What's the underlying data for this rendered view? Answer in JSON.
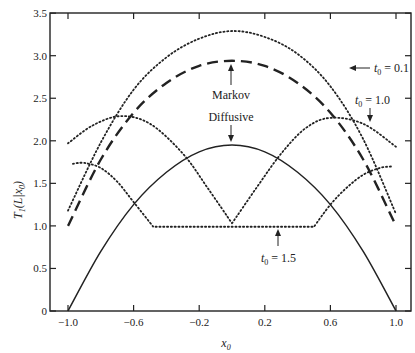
{
  "chart_data": {
    "type": "line",
    "title": "",
    "xlabel": "x0",
    "ylabel": "T1(L|x0)",
    "xlim": [
      -1.05,
      1.1
    ],
    "ylim": [
      0,
      3.5
    ],
    "x_ticks": [
      -1.0,
      -0.6,
      -0.2,
      0.2,
      0.6,
      1.0
    ],
    "x_tick_labels": [
      "-1.0",
      "-0.6",
      "-0.2",
      "0.2",
      "0.6",
      "1.0"
    ],
    "y_ticks": [
      0,
      0.5,
      1.0,
      1.5,
      2.0,
      2.5,
      3.0,
      3.5
    ],
    "y_tick_labels": [
      "0",
      "0.5",
      "1.0",
      "1.5",
      "2.0",
      "2.5",
      "3.0",
      "3.5"
    ],
    "grid": false,
    "legend": null,
    "series": [
      {
        "name": "Diffusive",
        "style": "solid",
        "x": [
          -1.0,
          -0.8,
          -0.6,
          -0.4,
          -0.2,
          0.0,
          0.2,
          0.4,
          0.6,
          0.8,
          1.0
        ],
        "y": [
          0.0,
          0.7,
          1.25,
          1.63,
          1.87,
          1.95,
          1.87,
          1.63,
          1.25,
          0.7,
          0.0
        ]
      },
      {
        "name": "Markov",
        "style": "dashed",
        "x": [
          -1.0,
          -0.8,
          -0.6,
          -0.4,
          -0.2,
          0.0,
          0.2,
          0.4,
          0.6,
          0.8,
          1.0
        ],
        "y": [
          1.0,
          1.78,
          2.33,
          2.68,
          2.88,
          2.94,
          2.88,
          2.68,
          2.33,
          1.78,
          1.0
        ]
      },
      {
        "name": "t0 = 0.1",
        "style": "dotted",
        "x": [
          -1.0,
          -0.8,
          -0.6,
          -0.4,
          -0.2,
          0.0,
          0.2,
          0.4,
          0.6,
          0.8,
          1.0
        ],
        "y": [
          1.18,
          1.98,
          2.6,
          2.98,
          3.2,
          3.29,
          3.22,
          3.02,
          2.64,
          2.02,
          1.14
        ]
      },
      {
        "name": "t0 = 1.0",
        "style": "dotted",
        "x": [
          -1.0,
          -0.85,
          -0.68,
          -0.5,
          -0.3,
          -0.15,
          0.0,
          0.15,
          0.3,
          0.45,
          0.6,
          0.8,
          1.0
        ],
        "y": [
          1.97,
          2.18,
          2.29,
          2.2,
          1.85,
          1.45,
          1.03,
          1.45,
          1.85,
          2.15,
          2.27,
          2.2,
          1.93
        ]
      },
      {
        "name": "t0 = 1.5",
        "style": "dotted",
        "x": [
          -0.97,
          -0.9,
          -0.8,
          -0.7,
          -0.6,
          -0.48,
          0.0,
          0.5,
          0.6,
          0.7,
          0.8,
          0.9,
          0.98
        ],
        "y": [
          1.73,
          1.74,
          1.68,
          1.52,
          1.28,
          0.99,
          0.99,
          0.99,
          1.25,
          1.45,
          1.6,
          1.68,
          1.7
        ]
      }
    ],
    "annotations": [
      {
        "text": "t0 = 0.1",
        "arrow_to": [
          0.82,
          2.92
        ]
      },
      {
        "text": "Markov",
        "arrow_to": [
          0.0,
          2.92
        ]
      },
      {
        "text": "Diffusive",
        "arrow_to": [
          0.0,
          1.97
        ]
      },
      {
        "text": "t0 = 1.0",
        "arrow_to": [
          0.85,
          2.2
        ]
      },
      {
        "text": "t0 = 1.5",
        "arrow_to": [
          0.28,
          1.0
        ]
      }
    ]
  },
  "labels": {
    "xlabel_main": "x",
    "xlabel_sub": "0",
    "ylabel_main": "T",
    "ylabel_sub": "1",
    "ylabel_rest": "(L|x",
    "ylabel_sub2": "0",
    "ylabel_close": ")",
    "annot_t01": "t",
    "annot_t01_sub": "0",
    "annot_t01_val": " = 0.1",
    "annot_markov": "Markov",
    "annot_diffusive": "Diffusive",
    "annot_t10": "t",
    "annot_t10_sub": "0",
    "annot_t10_val": " = 1.0",
    "annot_t15": "t",
    "annot_t15_sub": "0",
    "annot_t15_val": " = 1.5"
  },
  "colors": {
    "line": "#222222",
    "background": "#ffffff"
  }
}
